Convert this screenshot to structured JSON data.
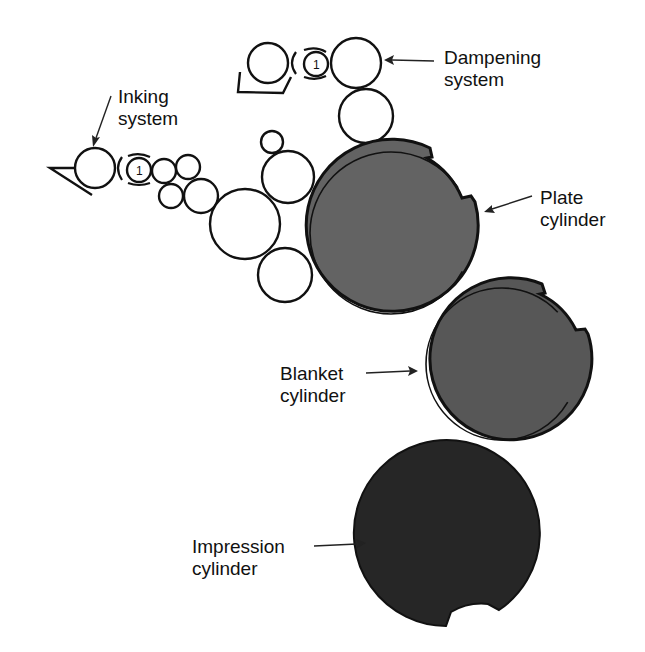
{
  "labels": {
    "dampening": {
      "line1": "Dampening",
      "line2": "system"
    },
    "inking": {
      "line1": "Inking",
      "line2": "system"
    },
    "plate": {
      "line1": "Plate",
      "line2": "cylinder"
    },
    "blanket": {
      "line1": "Blanket",
      "line2": "cylinder"
    },
    "impression": {
      "line1": "Impression",
      "line2": "cylinder"
    }
  },
  "roller_marks": {
    "ink_ductor": "1",
    "damp_ductor": "1"
  },
  "colors": {
    "plate_fill": "#636363",
    "blanket_fill": "#575757",
    "impression_fill": "#262626",
    "outline": "#111111",
    "background": "#ffffff"
  }
}
